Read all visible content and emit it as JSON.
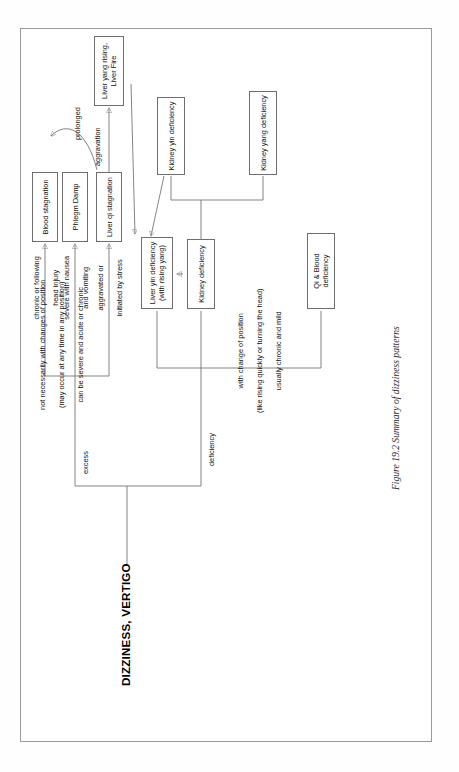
{
  "figure": {
    "title": "DIZZINESS, VERTIGO",
    "caption": "Figure 19.2 Summary of dizziness patterns"
  },
  "branches": {
    "deficiency": {
      "label": "deficiency",
      "description_line1": "with change of position",
      "description_line2": "(like rising quickly or turning the head)",
      "description_line3": "usually chronic and mild"
    },
    "excess": {
      "label": "excess",
      "description_line1": "not necessarily with changes of position",
      "description_line2": "(may occur at any time in any position)",
      "description_line3": "can be severe and acute or chronic"
    }
  },
  "nodes": {
    "qi_blood_deficiency": "Qi & Blood deficiency",
    "kidney_deficiency": "Kidney deficiency",
    "liver_yin_deficiency": "Liver yin deficiency\n(with rising yang)",
    "kidney_yin_deficiency": "Kidney yin deficiency",
    "kidney_yang_deficiency": "Kidney yang deficiency",
    "liver_qi_stagnation": "Liver qi stagnation",
    "phlegm_damp": "Phlegm Damp",
    "blood_stagnation": "Blood stagnation",
    "liver_yang_rising": "Liver yang rising,\nLiver Fire"
  },
  "edge_labels": {
    "aggravated_by_stress_line1": "aggravated or",
    "aggravated_by_stress_line2": "initiated by stress",
    "severe_nausea_line1": "severe with nausea",
    "severe_nausea_line2": "and vomiting",
    "chronic_head_injury_line1": "chronic or following",
    "chronic_head_injury_line2": "head injury",
    "aggravation": "aggravation",
    "prolonged": "prolonged"
  },
  "colors": {
    "ink": "#111111",
    "stroke": "#6e6e6e",
    "page": "#ffffff",
    "frame": "#9a9a9a"
  }
}
